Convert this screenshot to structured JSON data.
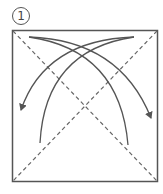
{
  "diagram": {
    "step_number": "1",
    "colors": {
      "line": "#555555",
      "background": "#ffffff"
    },
    "elements": [
      {
        "type": "square",
        "label": "paper"
      },
      {
        "type": "valley-fold-line",
        "label": "diagonal top-left to bottom-right"
      },
      {
        "type": "valley-fold-line",
        "label": "diagonal top-right to bottom-left"
      },
      {
        "type": "fold-arrow",
        "label": "fold top-left corner to bottom-right"
      },
      {
        "type": "fold-arrow",
        "label": "fold top-right corner to bottom-left"
      }
    ]
  }
}
